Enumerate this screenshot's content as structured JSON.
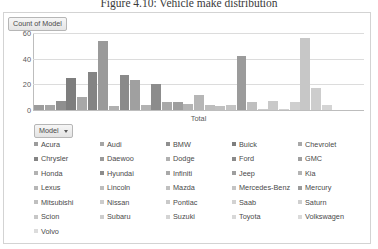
{
  "figure": {
    "caption": "Figure 4.10:  Vehicle make distribution"
  },
  "pivot": {
    "value_field_button": "Count of Model",
    "filter_field_button": "Model",
    "dropdown_icon": "chevron-down-icon"
  },
  "chart_data": {
    "type": "bar",
    "title": "Count of Model",
    "xlabel": "Total",
    "ylabel": "",
    "ylim": [
      0,
      60
    ],
    "yticks": [
      0,
      20,
      40,
      60
    ],
    "grid": true,
    "legend_position": "bottom",
    "categories": [
      "Acura",
      "Audi",
      "BMW",
      "Buick",
      "Chevrolet",
      "Chrysler",
      "Daewoo",
      "Dodge",
      "Ford",
      "GMC",
      "Honda",
      "Hyundai",
      "Infiniti",
      "Jeep",
      "Kia",
      "Lexus",
      "Lincoln",
      "Mazda",
      "Mercedes-Benz",
      "Mercury",
      "Mitsubishi",
      "Nissan",
      "Pontiac",
      "Saab",
      "Saturn",
      "Scion",
      "Subaru",
      "Suzuki",
      "Toyota",
      "Volkswagen",
      "Volvo"
    ],
    "values": [
      4,
      4,
      7,
      25,
      10,
      30,
      54,
      3,
      27,
      23,
      4,
      20,
      6,
      6,
      5,
      12,
      4,
      3,
      4,
      42,
      6,
      1,
      7,
      1,
      6,
      56,
      17,
      4,
      0,
      0,
      0
    ],
    "colors": [
      "#9c9c9c",
      "#a5a5a5",
      "#8f8f8f",
      "#7e7e7e",
      "#a8a8a8",
      "#848484",
      "#9a9a9a",
      "#b0b0b0",
      "#8a8a8a",
      "#a0a0a0",
      "#b2b2b2",
      "#8c8c8c",
      "#a9a9a9",
      "#9e9e9e",
      "#b4b4b4",
      "#b6b6b6",
      "#bdbdbd",
      "#c0c0c0",
      "#c4c4c4",
      "#9b9b9b",
      "#bfbfbf",
      "#cccccc",
      "#c9c9c9",
      "#d2d2d2",
      "#cfcfcf",
      "#c7c7c7",
      "#cdcdcd",
      "#d4d4d4",
      "#d8d8d8",
      "#dadada",
      "#dcdcdc"
    ]
  },
  "legend": {
    "items": [
      {
        "label": "Acura",
        "color": "#9c9c9c"
      },
      {
        "label": "Audi",
        "color": "#a5a5a5"
      },
      {
        "label": "BMW",
        "color": "#8f8f8f"
      },
      {
        "label": "Buick",
        "color": "#7e7e7e"
      },
      {
        "label": "Chevrolet",
        "color": "#a8a8a8"
      },
      {
        "label": "Chrysler",
        "color": "#848484"
      },
      {
        "label": "Daewoo",
        "color": "#9a9a9a"
      },
      {
        "label": "Dodge",
        "color": "#b0b0b0"
      },
      {
        "label": "Ford",
        "color": "#8a8a8a"
      },
      {
        "label": "GMC",
        "color": "#a0a0a0"
      },
      {
        "label": "Honda",
        "color": "#b2b2b2"
      },
      {
        "label": "Hyundai",
        "color": "#8c8c8c"
      },
      {
        "label": "Infiniti",
        "color": "#a9a9a9"
      },
      {
        "label": "Jeep",
        "color": "#9e9e9e"
      },
      {
        "label": "Kia",
        "color": "#b4b4b4"
      },
      {
        "label": "Lexus",
        "color": "#b6b6b6"
      },
      {
        "label": "Lincoln",
        "color": "#bdbdbd"
      },
      {
        "label": "Mazda",
        "color": "#c0c0c0"
      },
      {
        "label": "Mercedes-Benz",
        "color": "#c4c4c4"
      },
      {
        "label": "Mercury",
        "color": "#9b9b9b"
      },
      {
        "label": "Mitsubishi",
        "color": "#bfbfbf"
      },
      {
        "label": "Nissan",
        "color": "#cccccc"
      },
      {
        "label": "Pontiac",
        "color": "#c9c9c9"
      },
      {
        "label": "Saab",
        "color": "#d2d2d2"
      },
      {
        "label": "Saturn",
        "color": "#cfcfcf"
      },
      {
        "label": "Scion",
        "color": "#c7c7c7"
      },
      {
        "label": "Subaru",
        "color": "#cdcdcd"
      },
      {
        "label": "Suzuki",
        "color": "#d4d4d4"
      },
      {
        "label": "Toyota",
        "color": "#d8d8d8"
      },
      {
        "label": "Volkswagen",
        "color": "#dadada"
      },
      {
        "label": "Volvo",
        "color": "#dcdcdc"
      }
    ]
  }
}
